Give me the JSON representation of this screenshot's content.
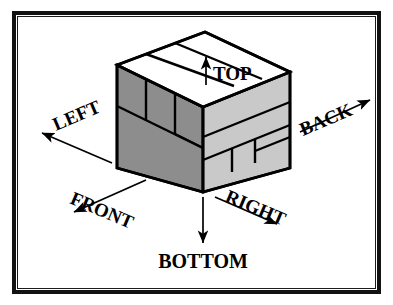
{
  "figure": {
    "background_color": "#ffffff",
    "border_color": "#121212",
    "face_colors": {
      "top": "#ffffff",
      "left_front": "#8d8d8d",
      "right_front": "#c9c9c9",
      "outline": "#000000"
    }
  },
  "labels": {
    "top": "TOP",
    "bottom": "BOTTOM",
    "left": "LEFT",
    "right": "RIGHT",
    "front": "FRONT",
    "back": "BACK"
  },
  "annotations": [
    {
      "name": "top-arrow",
      "label": "TOP",
      "direction": "up",
      "rotation_deg": 0
    },
    {
      "name": "bottom-arrow",
      "label": "BOTTOM",
      "direction": "down",
      "rotation_deg": 0
    },
    {
      "name": "left-arrow",
      "label": "LEFT",
      "direction": "up-left",
      "rotation_deg": -27
    },
    {
      "name": "right-arrow",
      "label": "RIGHT",
      "direction": "down-right",
      "rotation_deg": 27
    },
    {
      "name": "front-arrow",
      "label": "FRONT",
      "direction": "down-left",
      "rotation_deg": 27
    },
    {
      "name": "back-arrow",
      "label": "BACK",
      "direction": "up-right",
      "rotation_deg": -27
    }
  ],
  "cube": {
    "faces": [
      {
        "name": "top-face",
        "fill": "#ffffff",
        "courses": 3
      },
      {
        "name": "left-front-face",
        "fill": "#8d8d8d",
        "courses": 3
      },
      {
        "name": "right-front-face",
        "fill": "#c9c9c9",
        "courses": 3
      }
    ]
  }
}
